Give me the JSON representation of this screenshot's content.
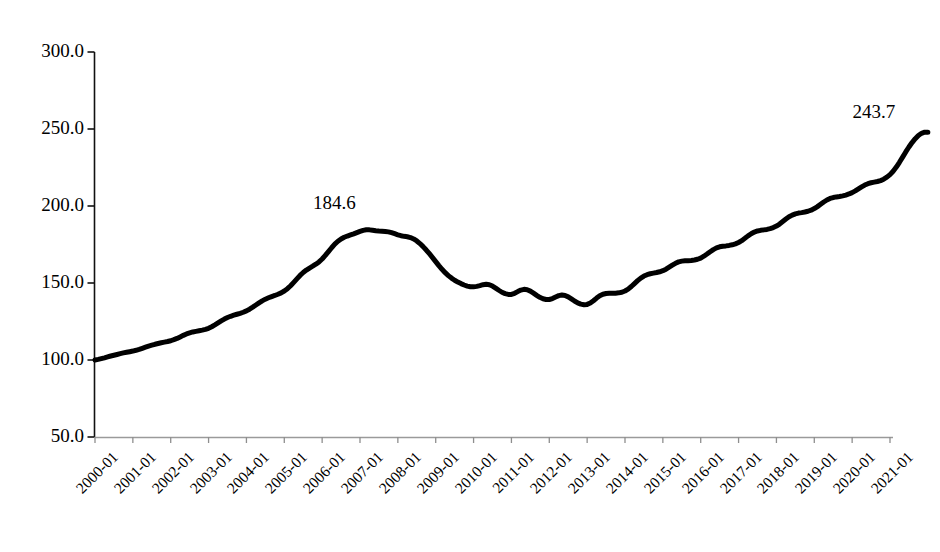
{
  "chart_data": {
    "type": "line",
    "title": "",
    "subtitle": "",
    "xlabel": "",
    "ylabel": "",
    "grid": false,
    "legend": false,
    "legend_position": "none",
    "xlim": [
      "2000-01",
      "2021-01"
    ],
    "ylim": [
      50.0,
      300.0
    ],
    "y_ticks": [
      "300.0",
      "250.0",
      "200.0",
      "150.0",
      "100.0",
      "50.0"
    ],
    "y_tick_values": [
      300.0,
      250.0,
      200.0,
      150.0,
      100.0,
      50.0
    ],
    "x_ticks": [
      "2000-01",
      "2001-01",
      "2002-01",
      "2003-01",
      "2004-01",
      "2005-01",
      "2006-01",
      "2007-01",
      "2008-01",
      "2009-01",
      "2010-01",
      "2011-01",
      "2012-01",
      "2013-01",
      "2014-01",
      "2015-01",
      "2016-01",
      "2017-01",
      "2018-01",
      "2019-01",
      "2020-01",
      "2021-01"
    ],
    "line_color": "#000000",
    "line_width": 5,
    "annotations": [
      {
        "text": "184.6",
        "x": "2006-07",
        "y": 184.6
      },
      {
        "text": "243.7",
        "x": "2020-10",
        "y": 243.7
      }
    ],
    "series": [
      {
        "name": "Index",
        "values": [
          100.0,
          100.4,
          100.9,
          101.4,
          102.0,
          102.6,
          103.1,
          103.6,
          104.1,
          104.6,
          105.0,
          105.4,
          105.8,
          106.3,
          106.9,
          107.6,
          108.3,
          109.0,
          109.6,
          110.2,
          110.7,
          111.2,
          111.6,
          112.0,
          112.5,
          113.2,
          114.0,
          115.0,
          116.0,
          116.9,
          117.6,
          118.2,
          118.6,
          119.0,
          119.4,
          119.9,
          120.6,
          121.6,
          122.8,
          124.1,
          125.4,
          126.6,
          127.6,
          128.4,
          129.1,
          129.7,
          130.3,
          131.0,
          131.9,
          133.0,
          134.3,
          135.7,
          137.1,
          138.4,
          139.5,
          140.4,
          141.2,
          141.9,
          142.7,
          143.6,
          144.8,
          146.3,
          148.2,
          150.4,
          152.7,
          154.9,
          156.8,
          158.4,
          159.7,
          160.9,
          162.2,
          163.7,
          165.6,
          167.9,
          170.4,
          172.9,
          175.2,
          177.1,
          178.6,
          179.7,
          180.5,
          181.2,
          181.9,
          182.7,
          183.5,
          184.2,
          184.6,
          184.5,
          184.2,
          183.9,
          183.7,
          183.6,
          183.5,
          183.2,
          182.7,
          182.0,
          181.3,
          180.7,
          180.3,
          180.0,
          179.5,
          178.6,
          177.3,
          175.6,
          173.6,
          171.4,
          169.0,
          166.5,
          163.9,
          161.3,
          158.9,
          156.7,
          154.8,
          153.2,
          151.8,
          150.6,
          149.6,
          148.7,
          148.0,
          147.6,
          147.5,
          147.8,
          148.3,
          148.9,
          149.2,
          148.9,
          148.0,
          146.7,
          145.3,
          144.0,
          143.1,
          142.6,
          142.6,
          143.3,
          144.4,
          145.4,
          145.9,
          145.6,
          144.7,
          143.4,
          142.0,
          140.7,
          139.8,
          139.3,
          139.3,
          139.9,
          140.9,
          141.8,
          142.2,
          141.9,
          141.0,
          139.7,
          138.3,
          137.1,
          136.3,
          135.9,
          136.1,
          137.0,
          138.5,
          140.2,
          141.7,
          142.7,
          143.2,
          143.4,
          143.4,
          143.4,
          143.6,
          144.0,
          144.8,
          146.0,
          147.7,
          149.6,
          151.5,
          153.2,
          154.5,
          155.4,
          156.0,
          156.4,
          156.8,
          157.3,
          158.0,
          159.0,
          160.3,
          161.6,
          162.8,
          163.7,
          164.2,
          164.4,
          164.5,
          164.6,
          164.9,
          165.4,
          166.2,
          167.4,
          168.8,
          170.3,
          171.7,
          172.8,
          173.5,
          173.9,
          174.1,
          174.4,
          174.8,
          175.4,
          176.3,
          177.5,
          179.0,
          180.6,
          182.0,
          183.1,
          183.8,
          184.2,
          184.5,
          184.8,
          185.3,
          186.0,
          187.0,
          188.3,
          189.9,
          191.5,
          193.0,
          194.1,
          194.9,
          195.4,
          195.7,
          196.1,
          196.6,
          197.3,
          198.3,
          199.6,
          201.1,
          202.6,
          203.9,
          204.9,
          205.5,
          205.9,
          206.2,
          206.6,
          207.1,
          207.8,
          208.7,
          209.8,
          211.1,
          212.4,
          213.6,
          214.5,
          215.1,
          215.5,
          215.9,
          216.5,
          217.4,
          218.7,
          220.4,
          222.6,
          225.3,
          228.4,
          231.7,
          235.1,
          238.3,
          241.2,
          243.7,
          245.8,
          247.2,
          247.9,
          247.9
        ]
      }
    ]
  },
  "axes": {
    "x_axis_name": "time-axis",
    "y_axis_name": "index-axis"
  }
}
